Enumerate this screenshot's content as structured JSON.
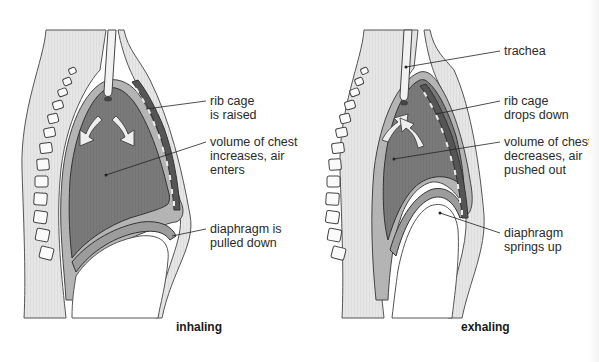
{
  "diagram": {
    "panels": [
      {
        "id": "inhaling",
        "caption": "inhaling",
        "labels": {
          "rib_cage": "rib cage\nis raised",
          "volume": "volume of chest\nincreases, air\nenters",
          "diaphragm": "diaphragm is\npulled down"
        },
        "arrow_direction": "down"
      },
      {
        "id": "exhaling",
        "caption": "exhaling",
        "labels": {
          "trachea": "trachea",
          "rib_cage": "rib cage\ndrops down",
          "volume": "volume of chest\ndecreases, air\npushed out",
          "diaphragm": "diaphragm\nsprings up"
        },
        "arrow_direction": "up"
      }
    ],
    "colors": {
      "lung_fill": "#7a7a7a",
      "pleura_band": "#b4b4b4",
      "body_band": "#e4e4e4",
      "outline": "#333333",
      "arrow_fill": "#eeeeee",
      "leader_line": "#222222",
      "text": "#2a2a2a"
    }
  }
}
